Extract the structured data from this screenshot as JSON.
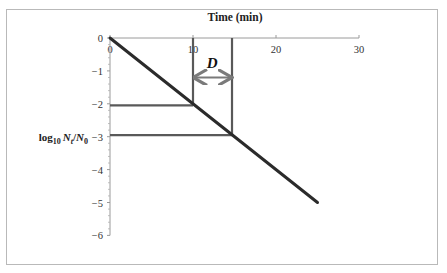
{
  "chart_data": {
    "type": "line",
    "title": "",
    "xlabel": "Time (min)",
    "ylabel": "log10 Nt/N0",
    "ylabel_parts": {
      "base": "log",
      "sub": "10",
      "n1": "N",
      "n1_sub": "t",
      "slash": "/",
      "n2": "N",
      "n2_sub": "0"
    },
    "xlim": [
      0,
      30
    ],
    "ylim": [
      -6,
      0
    ],
    "x_ticks": [
      0,
      10,
      20,
      30
    ],
    "x_tick_labels": [
      "0",
      "10",
      "20",
      "30"
    ],
    "y_ticks": [
      0,
      -1,
      -2,
      -3,
      -4,
      -5,
      -6
    ],
    "y_tick_labels": [
      "0",
      "-1",
      "-2",
      "-3",
      "-4",
      "-5",
      "-6"
    ],
    "x_axis_position": "top",
    "grid": false,
    "legend": null,
    "series": [
      {
        "name": "survival curve",
        "x": [
          0,
          25
        ],
        "y": [
          0,
          -5
        ],
        "color": "#2b2b2b"
      }
    ],
    "annotations": [
      {
        "type": "vline",
        "x": 10,
        "y_from": 0,
        "y_to": -2,
        "color": "#595959"
      },
      {
        "type": "vline",
        "x": 14.7,
        "y_from": 0,
        "y_to": -2.95,
        "color": "#595959"
      },
      {
        "type": "hline",
        "y": -2.05,
        "x_from": 0,
        "x_to": 10,
        "color": "#595959"
      },
      {
        "type": "hline",
        "y": -2.95,
        "x_from": 0,
        "x_to": 14.7,
        "color": "#595959"
      },
      {
        "type": "double-arrow",
        "x_from": 10,
        "x_to": 14.7,
        "y": -1.2,
        "color": "#7a7a7a"
      },
      {
        "type": "text",
        "text": "D",
        "x": 12.3,
        "y": -0.75,
        "style": "bold-italic"
      }
    ]
  }
}
